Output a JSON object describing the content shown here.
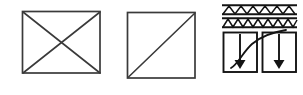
{
  "canvas": {
    "width": 303,
    "height": 95,
    "background": "#ffffff",
    "ink": "#2a2a2a",
    "ink_dark": "#111111",
    "description": "Scanned line-art engineering sketch containing three separate diagram figures drawn in black ink on a white background."
  },
  "figures": [
    {
      "id": "figure-1",
      "name": "rectangle-with-crossed-diagonals",
      "label": "Rectangle with both diagonals",
      "shape": "rectangle",
      "bounds": {
        "x": 22,
        "y": 11,
        "width": 78,
        "height": 62
      },
      "strokes": [
        {
          "name": "outline",
          "type": "rect"
        },
        {
          "name": "diagonal-top-left-to-bottom-right",
          "type": "line",
          "from": [
            22,
            11
          ],
          "to": [
            100,
            73
          ]
        },
        {
          "name": "diagonal-bottom-left-to-top-right",
          "type": "line",
          "from": [
            22,
            73
          ],
          "to": [
            100,
            11
          ]
        }
      ]
    },
    {
      "id": "figure-2",
      "name": "square-with-single-diagonal",
      "label": "Square with one diagonal",
      "shape": "square",
      "bounds": {
        "x": 127,
        "y": 12,
        "width": 68,
        "height": 66
      },
      "strokes": [
        {
          "name": "outline",
          "type": "rect"
        },
        {
          "name": "diagonal-bottom-left-to-top-right",
          "type": "line",
          "from": [
            127,
            78
          ],
          "to": [
            195,
            12
          ]
        }
      ]
    },
    {
      "id": "figure-3",
      "name": "truss-bands-with-load-arrows",
      "label": "Two hatched truss bands above two bays with downward arrows and a rising curve",
      "bounds": {
        "x": 222,
        "y": 4,
        "width": 75,
        "height": 68
      },
      "bands": [
        {
          "name": "upper-truss-band",
          "y": 5,
          "height": 9,
          "pattern": "zigzag-hatched",
          "zigzag_cells": 6
        },
        {
          "name": "lower-truss-band",
          "y": 18,
          "height": 9,
          "pattern": "zigzag-hatched",
          "zigzag_cells": 7
        }
      ],
      "bays": [
        {
          "name": "left-bay",
          "bounds": {
            "x": 223,
            "y": 32,
            "width": 34,
            "height": 40
          },
          "arrow": {
            "name": "downward-load-arrow-left",
            "from": [
              240,
              35
            ],
            "to": [
              240,
              68
            ],
            "head": "filled-triangle"
          }
        },
        {
          "name": "right-bay",
          "bounds": {
            "x": 262,
            "y": 32,
            "width": 34,
            "height": 40
          },
          "arrow": {
            "name": "downward-load-arrow-right",
            "from": [
              279,
              35
            ],
            "to": [
              279,
              68
            ],
            "head": "filled-triangle"
          }
        }
      ],
      "curve": {
        "name": "rising-response-curve",
        "from": [
          231,
          68
        ],
        "to": [
          285,
          31
        ],
        "shape": "concave-down-rising"
      }
    }
  ]
}
